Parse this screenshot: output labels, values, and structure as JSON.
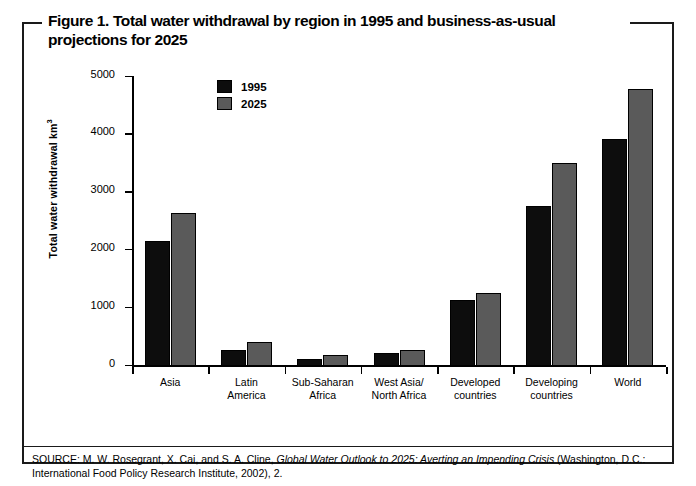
{
  "figure": {
    "title_line_1": "Figure 1. Total water withdrawal by region in 1995 and business-as-usual",
    "title_line_2": "projections for 2025",
    "source_prefix": "SOURCE: M. W. Rosegrant, X. Cai, and S. A. Cline, ",
    "source_italic": "Global Water Outlook to 2025: Averting an Impending Crisis",
    "source_suffix": " (Washington, D.C.: International Food Policy Research Institute, 2002), 2."
  },
  "legend": {
    "items": [
      {
        "label": "1995",
        "color": "#0d0d0d"
      },
      {
        "label": "2025",
        "color": "#5a5a5a"
      }
    ]
  },
  "axis": {
    "y_title_text": "Total water withdrawal km",
    "y_title_exponent": "3",
    "y_ticks": [
      "0",
      "1000",
      "2000",
      "3000",
      "4000",
      "5000"
    ]
  },
  "chart_data": {
    "type": "bar",
    "title": "Figure 1. Total water withdrawal by region in 1995 and business-as-usual projections for 2025",
    "xlabel": "",
    "ylabel": "Total water withdrawal km³",
    "ylim": [
      0,
      5000
    ],
    "yticks": [
      0,
      1000,
      2000,
      3000,
      4000,
      5000
    ],
    "grid": false,
    "legend_position": "upper-left-inside",
    "categories": [
      "Asia",
      "Latin\nAmerica",
      "Sub-Saharan\nAfrica",
      "West Asia/\nNorth Africa",
      "Developed\ncountries",
      "Developing\ncountries",
      "World"
    ],
    "category_labels": [
      [
        "Asia",
        ""
      ],
      [
        "Latin",
        "America"
      ],
      [
        "Sub-Saharan",
        "Africa"
      ],
      [
        "West Asia/",
        "North Africa"
      ],
      [
        "Developed",
        "countries"
      ],
      [
        "Developing",
        "countries"
      ],
      [
        "World",
        ""
      ]
    ],
    "series": [
      {
        "name": "1995",
        "color": "#0d0d0d",
        "values": [
          2160,
          270,
          128,
          225,
          1140,
          2770,
          3930
        ]
      },
      {
        "name": "2025",
        "color": "#5a5a5a",
        "values": [
          2650,
          415,
          195,
          285,
          1255,
          3520,
          4800
        ]
      }
    ]
  }
}
